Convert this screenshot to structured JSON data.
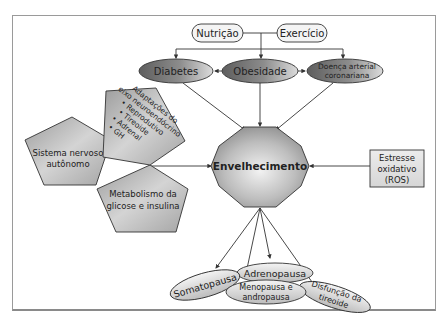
{
  "diagram": {
    "center": {
      "label": "Envelhecimento"
    },
    "lifestyle": [
      {
        "id": "nutricao",
        "label": "Nutrição"
      },
      {
        "id": "exercicio",
        "label": "Exercício"
      }
    ],
    "diseases": [
      {
        "id": "diabetes",
        "label": "Diabetes"
      },
      {
        "id": "obesidade",
        "label": "Obesidade"
      },
      {
        "id": "doenca",
        "label_line1": "Doença arterial",
        "label_line2": "coronariana"
      }
    ],
    "pentagons": {
      "neuro": {
        "lines": [
          "Adaptações do",
          "eixo neuroendócrino",
          "• Reprodutivo",
          "• Tireoide",
          "• Adrenal",
          "• GH"
        ]
      },
      "nervoso": {
        "line1": "Sistema nervoso",
        "line2": "autônomo"
      },
      "metabolismo": {
        "line1": "Metabolismo da",
        "line2": "glicose e insulina"
      }
    },
    "stress": {
      "line1": "Estresse",
      "line2": "oxidativo",
      "line3": "(ROS)"
    },
    "pauses": [
      {
        "id": "somatopausa",
        "label": "Somatopausa"
      },
      {
        "id": "adrenopausa",
        "label": "Adrenopausa"
      },
      {
        "id": "menopausa",
        "line1": "Menopausa e",
        "line2": "andropausa"
      },
      {
        "id": "tireoide",
        "line1": "Disfunção da",
        "line2": "tireoide"
      }
    ],
    "colors": {
      "frame": "#9a9a9a",
      "line": "#333333",
      "shape_dark": "#6e6e6e",
      "shape_mid": "#a8a8a8",
      "shape_light": "#e6e6e6"
    }
  }
}
